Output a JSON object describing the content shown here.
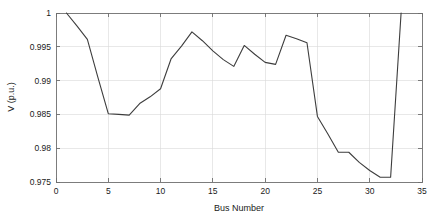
{
  "chart_data": {
    "type": "line",
    "title": "",
    "xlabel": "Bus Number",
    "ylabel": "V (p.u.)",
    "xlim": [
      0,
      35
    ],
    "ylim": [
      0.975,
      1
    ],
    "grid": true,
    "legend": null,
    "legend_position": "none",
    "xticks": [
      0,
      5,
      10,
      15,
      20,
      25,
      30,
      35
    ],
    "xtick_labels": [
      "0",
      "5",
      "10",
      "15",
      "20",
      "25",
      "30",
      "35"
    ],
    "yticks": [
      0.975,
      0.98,
      0.985,
      0.99,
      0.995,
      1
    ],
    "ytick_labels": [
      "0.975",
      "0.98",
      "0.985",
      "0.99",
      "0.995",
      "1"
    ],
    "line_color": "#3d3d3d",
    "grid_color": "#d9d9d9",
    "axis_color": "#6e6e6e",
    "series": [
      {
        "name": "Bus voltage profile",
        "x": [
          1,
          2,
          3,
          4,
          5,
          6,
          7,
          8,
          9,
          10,
          11,
          12,
          13,
          14,
          15,
          16,
          17,
          18,
          19,
          20,
          21,
          22,
          23,
          24,
          25,
          26,
          27,
          28,
          29,
          30,
          31,
          32,
          33
        ],
        "values": [
          1.0,
          0.9981,
          0.9961,
          0.9905,
          0.9851,
          0.985,
          0.9849,
          0.9866,
          0.9876,
          0.9888,
          0.9932,
          0.9951,
          0.9972,
          0.9959,
          0.9944,
          0.9931,
          0.9921,
          0.9952,
          0.9939,
          0.9927,
          0.9924,
          0.9967,
          0.9962,
          0.9956,
          0.9847,
          0.9821,
          0.9794,
          0.9794,
          0.9779,
          0.9767,
          0.9757,
          0.9757,
          1.0
        ]
      }
    ]
  }
}
